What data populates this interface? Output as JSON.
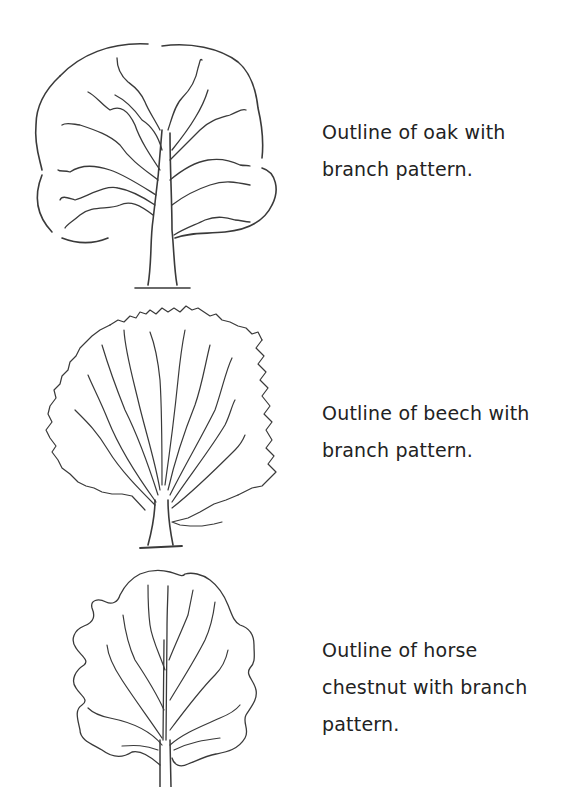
{
  "figures": [
    {
      "id": "oak",
      "illustration": "oak-tree-outline",
      "caption_lines": [
        "Outline of oak with",
        "branch pattern."
      ]
    },
    {
      "id": "beech",
      "illustration": "beech-tree-outline",
      "caption_lines": [
        "Outline of beech with",
        "branch pattern."
      ]
    },
    {
      "id": "horse_chestnut",
      "illustration": "horse-chestnut-tree-outline",
      "caption_lines": [
        "Outline of horse",
        "chestnut with branch",
        "pattern."
      ]
    }
  ],
  "colors": {
    "background": "#ffffff",
    "ink": "#3a3a3a",
    "text": "#222222"
  }
}
